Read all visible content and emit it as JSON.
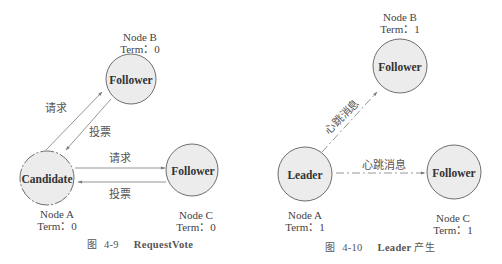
{
  "figures": [
    {
      "id": "4-9",
      "caption": {
        "prefix": "图",
        "number": "4-9",
        "title": "RequestVote"
      },
      "nodes": [
        {
          "key": "B",
          "name": "Node B",
          "term": "Term：0",
          "role": "Follower"
        },
        {
          "key": "A",
          "name": "Node A",
          "term": "Term：0",
          "role": "Candidate"
        },
        {
          "key": "C",
          "name": "Node C",
          "term": "Term：0",
          "role": "Follower"
        }
      ],
      "edges": [
        {
          "from": "A",
          "to": "B",
          "label": "请求"
        },
        {
          "from": "B",
          "to": "A",
          "label": "投票"
        },
        {
          "from": "A",
          "to": "C",
          "label": "请求"
        },
        {
          "from": "C",
          "to": "A",
          "label": "投票"
        }
      ]
    },
    {
      "id": "4-10",
      "caption": {
        "prefix": "图",
        "number": "4-10",
        "title": "Leader",
        "suffix": "产生"
      },
      "nodes": [
        {
          "key": "B",
          "name": "Node B",
          "term": "Term：1",
          "role": "Follower"
        },
        {
          "key": "A",
          "name": "Node A",
          "term": "Term：1",
          "role": "Leader"
        },
        {
          "key": "C",
          "name": "Node C",
          "term": "Term：1",
          "role": "Follower"
        }
      ],
      "edges": [
        {
          "from": "A",
          "to": "B",
          "label": "心跳消息"
        },
        {
          "from": "A",
          "to": "C",
          "label": "心跳消息"
        }
      ]
    }
  ],
  "colors": {
    "node_fill": "#ececec",
    "node_stroke": "#6e6e6e",
    "edge": "#8a8a8a",
    "text": "#3a3a3a"
  }
}
